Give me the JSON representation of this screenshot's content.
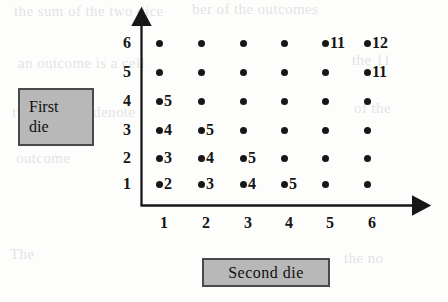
{
  "figure": {
    "type": "dice-outcome-grid",
    "x_axis_label": "Second die",
    "y_axis_label_line1": "First",
    "y_axis_label_line2": "die",
    "x_ticks": [
      "1",
      "2",
      "3",
      "4",
      "5",
      "6"
    ],
    "y_ticks": [
      "1",
      "2",
      "3",
      "4",
      "5",
      "6"
    ],
    "box_fill_color": "#b8b8b8",
    "box_border_color": "#4a4a4a",
    "dot_color": "#171717"
  },
  "chart_data": {
    "type": "scatter",
    "title": "",
    "xlabel": "Second die",
    "ylabel": "First die",
    "xlim": [
      0,
      7
    ],
    "ylim": [
      0,
      7
    ],
    "grid": false,
    "legend": "none",
    "xticks": [
      1,
      2,
      3,
      4,
      5,
      6
    ],
    "yticks": [
      1,
      2,
      3,
      4,
      5,
      6
    ],
    "points": [
      {
        "x": 1,
        "y": 1,
        "label": "2"
      },
      {
        "x": 2,
        "y": 1,
        "label": "3"
      },
      {
        "x": 3,
        "y": 1,
        "label": "4"
      },
      {
        "x": 4,
        "y": 1,
        "label": "5"
      },
      {
        "x": 5,
        "y": 1,
        "label": ""
      },
      {
        "x": 6,
        "y": 1,
        "label": ""
      },
      {
        "x": 1,
        "y": 2,
        "label": "3"
      },
      {
        "x": 2,
        "y": 2,
        "label": "4"
      },
      {
        "x": 3,
        "y": 2,
        "label": "5"
      },
      {
        "x": 4,
        "y": 2,
        "label": ""
      },
      {
        "x": 5,
        "y": 2,
        "label": ""
      },
      {
        "x": 6,
        "y": 2,
        "label": ""
      },
      {
        "x": 1,
        "y": 3,
        "label": "4"
      },
      {
        "x": 2,
        "y": 3,
        "label": "5"
      },
      {
        "x": 3,
        "y": 3,
        "label": ""
      },
      {
        "x": 4,
        "y": 3,
        "label": ""
      },
      {
        "x": 5,
        "y": 3,
        "label": ""
      },
      {
        "x": 6,
        "y": 3,
        "label": ""
      },
      {
        "x": 1,
        "y": 4,
        "label": "5"
      },
      {
        "x": 2,
        "y": 4,
        "label": ""
      },
      {
        "x": 3,
        "y": 4,
        "label": ""
      },
      {
        "x": 4,
        "y": 4,
        "label": ""
      },
      {
        "x": 5,
        "y": 4,
        "label": ""
      },
      {
        "x": 6,
        "y": 4,
        "label": ""
      },
      {
        "x": 1,
        "y": 5,
        "label": ""
      },
      {
        "x": 2,
        "y": 5,
        "label": ""
      },
      {
        "x": 3,
        "y": 5,
        "label": ""
      },
      {
        "x": 4,
        "y": 5,
        "label": ""
      },
      {
        "x": 5,
        "y": 5,
        "label": ""
      },
      {
        "x": 6,
        "y": 5,
        "label": "11"
      },
      {
        "x": 1,
        "y": 6,
        "label": ""
      },
      {
        "x": 2,
        "y": 6,
        "label": ""
      },
      {
        "x": 3,
        "y": 6,
        "label": ""
      },
      {
        "x": 4,
        "y": 6,
        "label": ""
      },
      {
        "x": 5,
        "y": 6,
        "label": "11"
      },
      {
        "x": 6,
        "y": 6,
        "label": "12"
      }
    ]
  },
  "background_ghost_text": [
    {
      "text": "the  sum  of  the  two  dice",
      "x": 14,
      "y": 3,
      "size": 15
    },
    {
      "text": "ber  of  the  outcomes",
      "x": 192,
      "y": 1,
      "size": 15
    },
    {
      "text": "an  outcome  is  a  cell",
      "x": 18,
      "y": 55,
      "size": 15
    },
    {
      "text": "the  11",
      "x": 352,
      "y": 52,
      "size": 15
    },
    {
      "text": "two  dice  we  denote",
      "x": 12,
      "y": 104,
      "size": 15
    },
    {
      "text": "of  the",
      "x": 354,
      "y": 100,
      "size": 15
    },
    {
      "text": "outcome",
      "x": 16,
      "y": 150,
      "size": 15
    },
    {
      "text": "The",
      "x": 10,
      "y": 246,
      "size": 15
    },
    {
      "text": "the  no",
      "x": 344,
      "y": 250,
      "size": 15
    }
  ]
}
